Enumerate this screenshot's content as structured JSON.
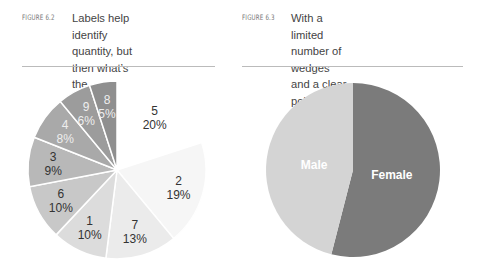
{
  "figures": [
    {
      "label": "FIGURE 6.2",
      "caption_lines": [
        "Labels help identify",
        "quantity, but then what’s the",
        "purpose of the visualization?"
      ]
    },
    {
      "label": "FIGURE 6.3",
      "caption_lines": [
        "With a limited number of wedges",
        "and a clear point, the pie chart is",
        "an acceptable visualization."
      ]
    }
  ],
  "chart_data": [
    {
      "type": "pie",
      "title": "Labels help identify quantity, but then what’s the purpose of the visualization?",
      "categories": [
        "5",
        "2",
        "7",
        "1",
        "6",
        "3",
        "4",
        "9",
        "8"
      ],
      "values": [
        20,
        19,
        13,
        10,
        10,
        9,
        8,
        6,
        5
      ],
      "value_labels": [
        "20%",
        "19%",
        "13%",
        "10%",
        "10%",
        "9%",
        "8%",
        "6%",
        "5%"
      ],
      "colors": [
        "#ffffff",
        "#f6f6f6",
        "#ebebeb",
        "#dcdcdc",
        "#c8c8c8",
        "#b8b8b8",
        "#a9a9a9",
        "#9c9c9c",
        "#8f8f8f"
      ],
      "label_colors": [
        "#333333",
        "#333333",
        "#333333",
        "#333333",
        "#333333",
        "#333333",
        "#eeeeee",
        "#eeeeee",
        "#eeeeee"
      ],
      "start_angle": "12 o'clock, clockwise"
    },
    {
      "type": "pie",
      "title": "With a limited number of wedges and a clear point, the pie chart is an acceptable visualization.",
      "categories": [
        "Female",
        "Male"
      ],
      "values": [
        54,
        46
      ],
      "colors": [
        "#7b7b7b",
        "#d4d4d4"
      ],
      "label_colors": [
        "#ffffff",
        "#ffffff"
      ],
      "start_angle": "12 o'clock, clockwise"
    }
  ]
}
